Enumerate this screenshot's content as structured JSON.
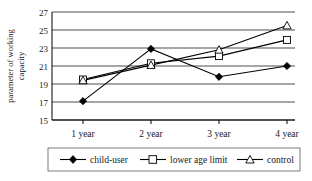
{
  "chart_data": {
    "type": "line",
    "title": "",
    "xlabel": "",
    "ylabel": "parameter of working capacity",
    "ylabel_line1": "parameter of working",
    "ylabel_line2": "capacity",
    "categories": [
      "1 year",
      "2 year",
      "3 year",
      "4 year"
    ],
    "ylim": [
      15,
      27
    ],
    "yticks": [
      15,
      17,
      19,
      21,
      23,
      25,
      27
    ],
    "ytick_labels": [
      "15",
      "17",
      "19",
      "21",
      "23",
      "25",
      "27"
    ],
    "grid": "horizontal",
    "legend_position": "bottom",
    "series": [
      {
        "name": "child-user",
        "marker": "filled-diamond",
        "color": "#000000",
        "values": [
          17.1,
          22.9,
          19.8,
          21.0
        ]
      },
      {
        "name": "lower age limit",
        "marker": "open-square",
        "color": "#000000",
        "values": [
          19.5,
          21.3,
          22.1,
          23.9
        ]
      },
      {
        "name": "control",
        "marker": "open-triangle",
        "color": "#000000",
        "values": [
          19.4,
          21.1,
          22.8,
          25.5
        ]
      }
    ]
  },
  "legend": {
    "items": [
      {
        "label": "child-user",
        "marker": "filled-diamond"
      },
      {
        "label": "lower age limit",
        "marker": "open-square"
      },
      {
        "label": "control",
        "marker": "open-triangle"
      }
    ]
  },
  "colors": {
    "ink": "#000000",
    "background": "#ffffff",
    "legend_border": "#5a5a5a"
  }
}
